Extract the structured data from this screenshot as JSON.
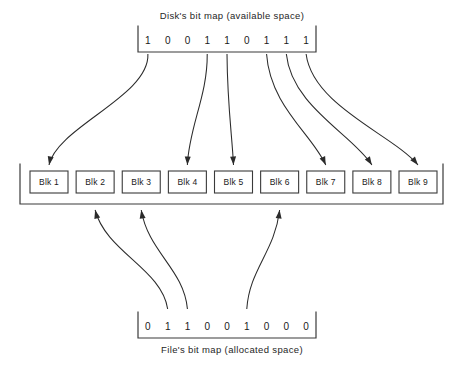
{
  "diagram": {
    "title_top": "Disk's bit map (available space)",
    "title_bottom": "File's bit map (allocated space)",
    "disk_bitmap": {
      "label": "Disk's bit map (available space)",
      "bits": [
        "1",
        "0",
        "0",
        "1",
        "1",
        "0",
        "1",
        "1",
        "1"
      ]
    },
    "file_bitmap": {
      "label": "File's bit map (allocated space)",
      "bits": [
        "0",
        "1",
        "1",
        "0",
        "0",
        "1",
        "0",
        "0",
        "0"
      ]
    },
    "blocks": [
      {
        "label": "Blk 1"
      },
      {
        "label": "Blk 2"
      },
      {
        "label": "Blk 3"
      },
      {
        "label": "Blk 4"
      },
      {
        "label": "Blk 5"
      },
      {
        "label": "Blk 6"
      },
      {
        "label": "Blk 7"
      },
      {
        "label": "Blk 8"
      },
      {
        "label": "Blk 9"
      }
    ],
    "disk_arrows": [
      {
        "from_bit": 1,
        "to_block": 1
      },
      {
        "from_bit": 4,
        "to_block": 4
      },
      {
        "from_bit": 5,
        "to_block": 5
      },
      {
        "from_bit": 7,
        "to_block": 7
      },
      {
        "from_bit": 8,
        "to_block": 8
      },
      {
        "from_bit": 9,
        "to_block": 9
      }
    ],
    "file_arrows": [
      {
        "from_bit": 2,
        "to_block": 2
      },
      {
        "from_bit": 3,
        "to_block": 3
      },
      {
        "from_bit": 6,
        "to_block": 6
      }
    ],
    "colors": {
      "background": "#ffffff",
      "stroke": "#3a3a3a",
      "arrow": "#2b2b2b",
      "text": "#1a1a1a"
    }
  }
}
